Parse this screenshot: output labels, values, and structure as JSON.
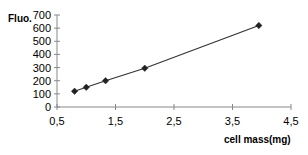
{
  "chart_data": {
    "type": "scatter",
    "title": "",
    "xlabel": "cell mass(mg)",
    "ylabel": "Fluo.",
    "xlim": [
      0.5,
      4.5
    ],
    "ylim": [
      0,
      700
    ],
    "x_ticks": [
      "0,5",
      "1,5",
      "2,5",
      "3,5",
      "4,5"
    ],
    "x_tick_values": [
      0.5,
      1.5,
      2.5,
      3.5,
      4.5
    ],
    "y_ticks": [
      "0",
      "100",
      "200",
      "300",
      "400",
      "500",
      "600",
      "700"
    ],
    "y_tick_values": [
      0,
      100,
      200,
      300,
      400,
      500,
      600,
      700
    ],
    "grid": false,
    "legend": null,
    "series": [
      {
        "name": "Fluorescence vs cell mass",
        "marker": "diamond",
        "line": "linear-trend",
        "x": [
          0.8,
          1.0,
          1.33,
          2.0,
          3.95
        ],
        "y": [
          120,
          150,
          200,
          295,
          620
        ]
      }
    ],
    "colors": {
      "axis": "#888888",
      "line": "#333333",
      "marker": "#222222"
    }
  }
}
